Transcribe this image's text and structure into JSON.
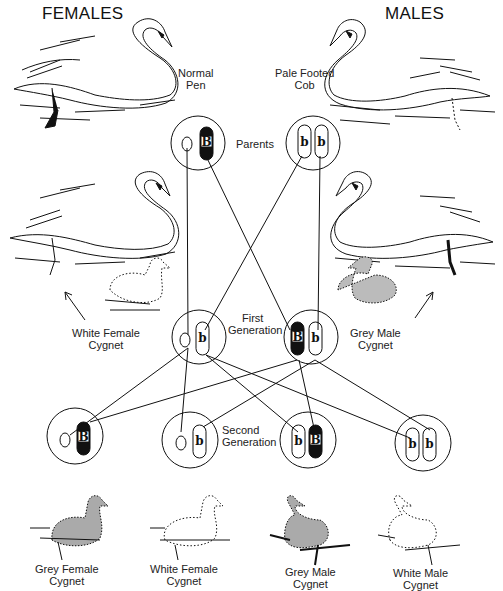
{
  "headers": {
    "females": "FEMALES",
    "males": "MALES"
  },
  "parents": {
    "label": "Parents",
    "female": {
      "name_line1": "Normal",
      "name_line2": "Pen",
      "chromosomes": [
        "",
        "B"
      ]
    },
    "male": {
      "name_line1": "Pale Footed",
      "name_line2": "Cob",
      "chromosomes": [
        "b",
        "b"
      ]
    }
  },
  "first_generation": {
    "label_line1": "First",
    "label_line2": "Generation",
    "female": {
      "name_line1": "White Female",
      "name_line2": "Cygnet",
      "chromosomes": [
        "",
        "b"
      ]
    },
    "male": {
      "name_line1": "Grey Male",
      "name_line2": "Cygnet",
      "chromosomes": [
        "B",
        "b"
      ]
    }
  },
  "second_generation": {
    "label_line1": "Second",
    "label_line2": "Generation",
    "offspring": [
      {
        "name_line1": "Grey Female",
        "name_line2": "Cygnet",
        "chromosomes": [
          "",
          "B"
        ]
      },
      {
        "name_line1": "White Female",
        "name_line2": "Cygnet",
        "chromosomes": [
          "",
          "b"
        ]
      },
      {
        "name_line1": "Grey Male",
        "name_line2": "Cygnet",
        "chromosomes": [
          "b",
          "B"
        ]
      },
      {
        "name_line1": "White Male",
        "name_line2": "Cygnet",
        "chromosomes": [
          "b",
          "b"
        ]
      }
    ]
  },
  "colors": {
    "ink": "#111111",
    "dominant_fill": "#111111",
    "background": "#ffffff"
  }
}
